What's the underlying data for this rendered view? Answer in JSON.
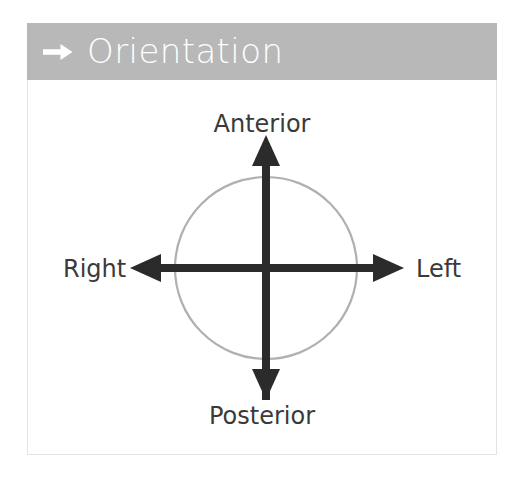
{
  "slide": {
    "background_color": "#ffffff"
  },
  "header": {
    "title": "Orientation",
    "icon": "right-arrow-icon",
    "background_color": "#b8b8b8",
    "text_color": "#ffffff"
  },
  "diagram": {
    "type": "anatomical-orientation-axes",
    "circle_color": "#b0b0b0",
    "axis_color": "#2b2b2b",
    "labels": {
      "anterior": "Anterior",
      "posterior": "Posterior",
      "right": "Right",
      "left": "Left"
    },
    "axes": [
      {
        "direction": "up",
        "label": "Anterior"
      },
      {
        "direction": "down",
        "label": "Posterior"
      },
      {
        "direction": "left",
        "label": "Right"
      },
      {
        "direction": "right",
        "label": "Left"
      }
    ]
  }
}
